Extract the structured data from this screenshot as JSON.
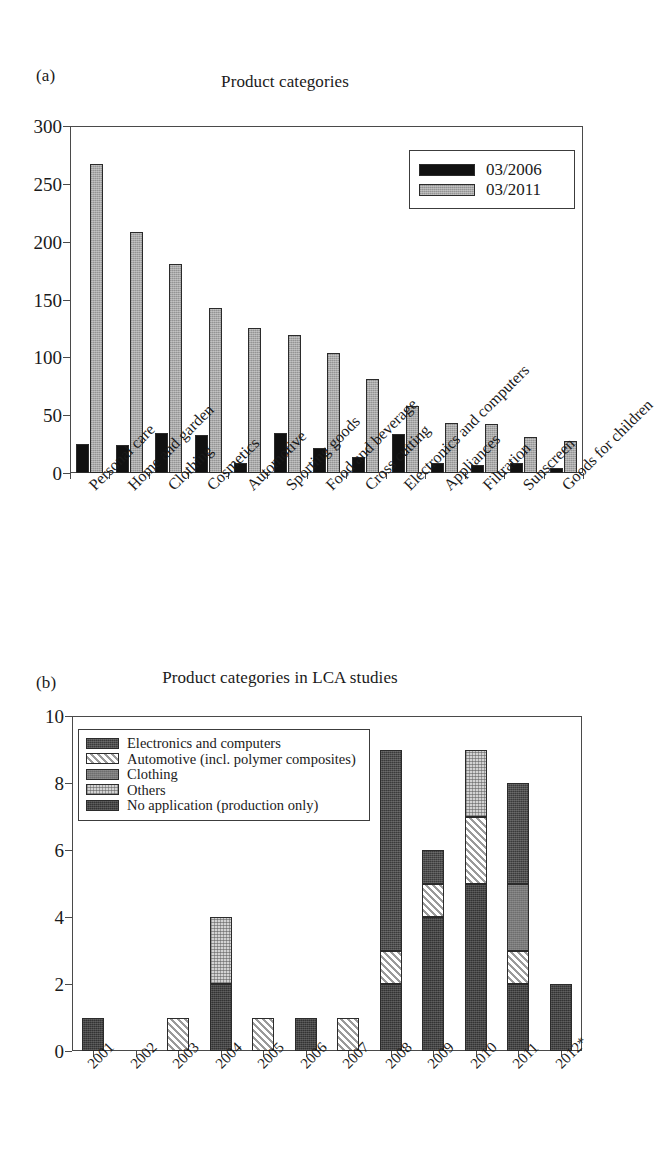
{
  "figure": {
    "panels": [
      {
        "letter": "(a)",
        "title": "Product categories"
      },
      {
        "letter": "(b)",
        "title": "Product categories in LCA studies"
      }
    ]
  },
  "chart_data": [
    {
      "type": "bar",
      "panel": "(a)",
      "title": "Product categories",
      "xlabel": "",
      "ylabel": "",
      "ylim": [
        0,
        300
      ],
      "yticks": [
        0,
        50,
        100,
        150,
        200,
        250,
        300
      ],
      "grid": false,
      "legend_position": "top-right",
      "categories": [
        "Personal care",
        "Home and garden",
        "Clothing",
        "Cosmetics",
        "Automotive",
        "Sporting goods",
        "Food and beverage",
        "Cross cutting",
        "Electronics and computers",
        "Appliances",
        "Filtration",
        "Sunscreen",
        "Goods for children"
      ],
      "series": [
        {
          "name": "03/2006",
          "color": "#111111",
          "values": [
            25,
            24,
            35,
            33,
            9,
            35,
            22,
            14,
            34,
            9,
            7,
            9,
            4
          ]
        },
        {
          "name": "03/2011",
          "color": "#a8a8a8",
          "values": [
            267,
            208,
            181,
            143,
            125,
            119,
            104,
            81,
            58,
            43,
            42,
            31,
            28
          ]
        }
      ]
    },
    {
      "type": "bar",
      "panel": "(b)",
      "title": "Product categories in LCA studies",
      "stacked": true,
      "xlabel": "",
      "ylabel": "",
      "ylim": [
        0,
        10
      ],
      "yticks": [
        0,
        2,
        4,
        6,
        8,
        10
      ],
      "grid": false,
      "legend_position": "top-left",
      "categories": [
        "2001",
        "2002",
        "2003",
        "2004",
        "2005",
        "2006",
        "2007",
        "2008",
        "2009",
        "2010",
        "2011",
        "2012*"
      ],
      "series": [
        {
          "name": "Electronics and computers",
          "fill": "electronics",
          "values": [
            0,
            0,
            0,
            0,
            0,
            0,
            0,
            6,
            1,
            0,
            3,
            0
          ]
        },
        {
          "name": "Automotive (incl. polymer composites)",
          "fill": "automotive",
          "values": [
            0,
            0,
            1,
            0,
            1,
            0,
            1,
            1,
            1,
            2,
            1,
            0
          ]
        },
        {
          "name": "Clothing",
          "fill": "clothing",
          "values": [
            0,
            0,
            0,
            0,
            0,
            0,
            0,
            0,
            0,
            0,
            2,
            0
          ]
        },
        {
          "name": "Others",
          "fill": "others",
          "values": [
            0,
            0,
            0,
            2,
            0,
            0,
            0,
            0,
            0,
            2,
            0,
            0
          ]
        },
        {
          "name": "No application (production only)",
          "fill": "noapp",
          "values": [
            1,
            0,
            0,
            2,
            0,
            1,
            0,
            2,
            4,
            5,
            2,
            2
          ]
        }
      ],
      "totals": [
        1,
        0,
        1,
        4,
        1,
        1,
        1,
        9,
        6,
        9,
        8,
        2
      ]
    }
  ],
  "panel_a": {
    "letter": "(a)",
    "title": "Product categories",
    "yticks": [
      "300",
      "250",
      "200",
      "150",
      "100",
      "50",
      "0"
    ],
    "categories": [
      "Personal care",
      "Home and garden",
      "Clothing",
      "Cosmetics",
      "Automotive",
      "Sporting goods",
      "Food and beverage",
      "Cross cutting",
      "Electronics and computers",
      "Appliances",
      "Filtration",
      "Sunscreen",
      "Goods for children"
    ],
    "legend": [
      {
        "label": "03/2006",
        "fill": "black"
      },
      {
        "label": "03/2011",
        "fill": "gray"
      }
    ]
  },
  "panel_b": {
    "letter": "(b)",
    "title": "Product categories in LCA studies",
    "yticks": [
      "10",
      "8",
      "6",
      "4",
      "2",
      "0"
    ],
    "years": [
      "2001",
      "2002",
      "2003",
      "2004",
      "2005",
      "2006",
      "2007",
      "2008",
      "2009",
      "2010",
      "2011",
      "2012*"
    ],
    "legend": [
      {
        "label": "Electronics and computers",
        "fill": "electronics"
      },
      {
        "label": "Automotive (incl. polymer composites)",
        "fill": "automotive"
      },
      {
        "label": "Clothing",
        "fill": "clothing"
      },
      {
        "label": "Others",
        "fill": "others"
      },
      {
        "label": "No application (production only)",
        "fill": "noapp"
      }
    ]
  }
}
